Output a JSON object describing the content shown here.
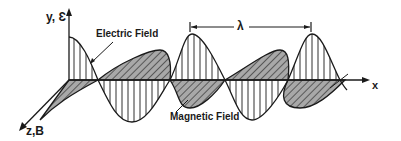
{
  "diagram": {
    "axes": {
      "y_label": "y, Ɛ",
      "x_label": "x",
      "z_label": "z,B"
    },
    "labels": {
      "electric_field": "Electric Field",
      "magnetic_field": "Magnetic Field",
      "wavelength": "λ"
    },
    "colors": {
      "ink": "#1a1a1a",
      "hatch_fill": "#9a9a9a",
      "background": "#ffffff"
    }
  }
}
